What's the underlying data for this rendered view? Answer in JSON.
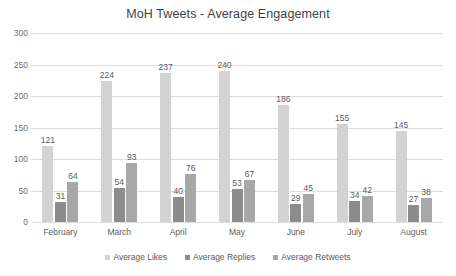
{
  "chart_data": {
    "type": "bar",
    "title": "MoH Tweets - Average Engagement",
    "xlabel": "",
    "ylabel": "",
    "ylim": [
      0,
      300
    ],
    "yticks": [
      0,
      50,
      100,
      150,
      200,
      250,
      300
    ],
    "grid": true,
    "legend_position": "bottom",
    "categories": [
      "February",
      "March",
      "April",
      "May",
      "June",
      "July",
      "August"
    ],
    "series": [
      {
        "name": "Average Likes",
        "color": "#d3d3d3",
        "values": [
          121,
          224,
          237,
          240,
          186,
          155,
          145
        ]
      },
      {
        "name": "Average Replies",
        "color": "#8c8c8c",
        "values": [
          31,
          54,
          40,
          53,
          29,
          34,
          27
        ]
      },
      {
        "name": "Average Retweets",
        "color": "#a8a8a8",
        "values": [
          64,
          93,
          76,
          67,
          45,
          42,
          38
        ]
      }
    ]
  }
}
